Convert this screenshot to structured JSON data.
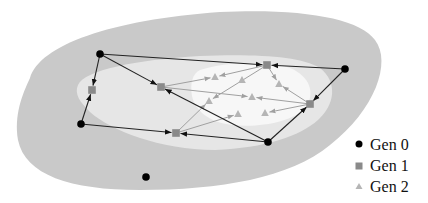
{
  "colors": {
    "background": "#ffffff",
    "outer_region": "#c9c9c9",
    "middle_region": "#e6e6e6",
    "inner_region": "#f7f7f7",
    "gen0": "#000000",
    "gen1": "#8a8a8a",
    "gen2": "#b5b5b5",
    "edge_gen0": "#222222",
    "edge_gen1": "#a0a0a0"
  },
  "legend": {
    "items": [
      {
        "label": "Gen 0",
        "shape": "circle"
      },
      {
        "label": "Gen 1",
        "shape": "square"
      },
      {
        "label": "Gen 2",
        "shape": "triangle"
      }
    ]
  },
  "nodes": {
    "gen0": [
      {
        "id": "a",
        "x": 100,
        "y": 54
      },
      {
        "id": "b",
        "x": 345,
        "y": 69
      },
      {
        "id": "c",
        "x": 81,
        "y": 124
      },
      {
        "id": "d",
        "x": 268,
        "y": 142
      },
      {
        "id": "e",
        "x": 146,
        "y": 177
      }
    ],
    "gen1": [
      {
        "id": "p",
        "x": 92,
        "y": 90
      },
      {
        "id": "q",
        "x": 161,
        "y": 87
      },
      {
        "id": "r",
        "x": 267,
        "y": 65
      },
      {
        "id": "s",
        "x": 310,
        "y": 104
      },
      {
        "id": "t",
        "x": 176,
        "y": 133
      }
    ],
    "gen2": [
      {
        "id": "u1",
        "x": 215,
        "y": 77
      },
      {
        "id": "u2",
        "x": 242,
        "y": 80
      },
      {
        "id": "u3",
        "x": 209,
        "y": 101
      },
      {
        "id": "u4",
        "x": 252,
        "y": 97
      },
      {
        "id": "u5",
        "x": 279,
        "y": 84
      },
      {
        "id": "u6",
        "x": 238,
        "y": 114
      },
      {
        "id": "u7",
        "x": 265,
        "y": 113
      }
    ]
  },
  "edges": {
    "gen0_to_gen1": [
      {
        "from": [
          100,
          54
        ],
        "to": [
          92,
          90
        ]
      },
      {
        "from": [
          100,
          54
        ],
        "to": [
          161,
          87
        ]
      },
      {
        "from": [
          100,
          54
        ],
        "to": [
          267,
          65
        ]
      },
      {
        "from": [
          345,
          69
        ],
        "to": [
          267,
          65
        ]
      },
      {
        "from": [
          345,
          69
        ],
        "to": [
          310,
          104
        ]
      },
      {
        "from": [
          81,
          124
        ],
        "to": [
          92,
          90
        ]
      },
      {
        "from": [
          81,
          124
        ],
        "to": [
          176,
          133
        ]
      },
      {
        "from": [
          268,
          142
        ],
        "to": [
          161,
          87
        ]
      },
      {
        "from": [
          268,
          142
        ],
        "to": [
          176,
          133
        ]
      },
      {
        "from": [
          268,
          142
        ],
        "to": [
          310,
          104
        ]
      }
    ],
    "gen1_to_gen2": [
      {
        "from": [
          161,
          87
        ],
        "to": [
          215,
          77
        ]
      },
      {
        "from": [
          161,
          87
        ],
        "to": [
          252,
          97
        ]
      },
      {
        "from": [
          267,
          65
        ],
        "to": [
          215,
          77
        ]
      },
      {
        "from": [
          267,
          65
        ],
        "to": [
          209,
          101
        ]
      },
      {
        "from": [
          267,
          65
        ],
        "to": [
          279,
          84
        ]
      },
      {
        "from": [
          310,
          104
        ],
        "to": [
          279,
          84
        ]
      },
      {
        "from": [
          310,
          104
        ],
        "to": [
          252,
          97
        ]
      },
      {
        "from": [
          310,
          104
        ],
        "to": [
          265,
          113
        ]
      },
      {
        "from": [
          176,
          133
        ],
        "to": [
          209,
          101
        ]
      },
      {
        "from": [
          176,
          133
        ],
        "to": [
          238,
          114
        ]
      }
    ]
  }
}
